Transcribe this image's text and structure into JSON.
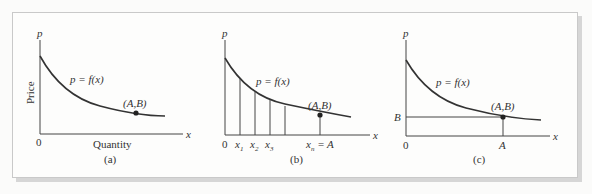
{
  "figure": {
    "panels": [
      {
        "id": "a",
        "caption": "(a)",
        "y_axis_label": "p",
        "x_axis_label": "x",
        "y_axis_title": "Price",
        "x_axis_title": "Quantity",
        "origin_label": "0",
        "curve_label": "p = f(x)",
        "point_label": "(A,B)"
      },
      {
        "id": "b",
        "caption": "(b)",
        "y_axis_label": "p",
        "x_axis_label": "x",
        "origin_label": "0",
        "curve_label": "p = f(x)",
        "point_label": "(A,B)",
        "tick_labels": [
          "x1",
          "x2",
          "x3",
          "xn = A"
        ]
      },
      {
        "id": "c",
        "caption": "(c)",
        "y_axis_label": "p",
        "x_axis_label": "x",
        "origin_label": "0",
        "curve_label": "p = f(x)",
        "point_label": "(A,B)",
        "y_tick_label": "B",
        "x_tick_label": "A"
      }
    ]
  }
}
